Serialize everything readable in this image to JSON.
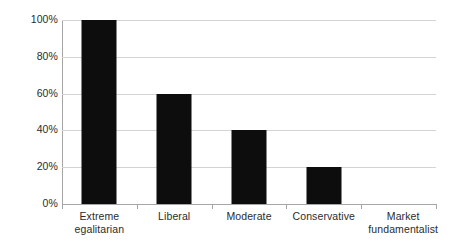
{
  "chart_data": {
    "type": "bar",
    "title": "",
    "subtitle": "",
    "xlabel": "",
    "ylabel": "",
    "categories": [
      "Extreme egalitarian",
      "Liberal",
      "Moderate",
      "Conservative",
      "Market fundamentalist"
    ],
    "category_lines": [
      [
        "Extreme",
        "egalitarian"
      ],
      [
        "Liberal"
      ],
      [
        "Moderate"
      ],
      [
        "Conservative"
      ],
      [
        "Market",
        "fundamentalist"
      ]
    ],
    "values": [
      100,
      60,
      40,
      20,
      0
    ],
    "value_unit": "%",
    "ylim": [
      0,
      100
    ],
    "ytick_values": [
      0,
      20,
      40,
      60,
      80,
      100
    ],
    "ytick_labels": [
      "0%",
      "20%",
      "40%",
      "60%",
      "80%",
      "100%"
    ],
    "grid": true,
    "grid_axis": "y",
    "legend": false,
    "legend_position": "none",
    "series": [
      {
        "name": "",
        "values": [
          100,
          60,
          40,
          20,
          0
        ],
        "color": "#0d0d0d"
      }
    ]
  },
  "colors": {
    "bar": "#0d0d0d",
    "gridline": "#d4d4d4",
    "axis": "#a6a6a6",
    "text": "#2b2b2b",
    "background": "#ffffff"
  }
}
